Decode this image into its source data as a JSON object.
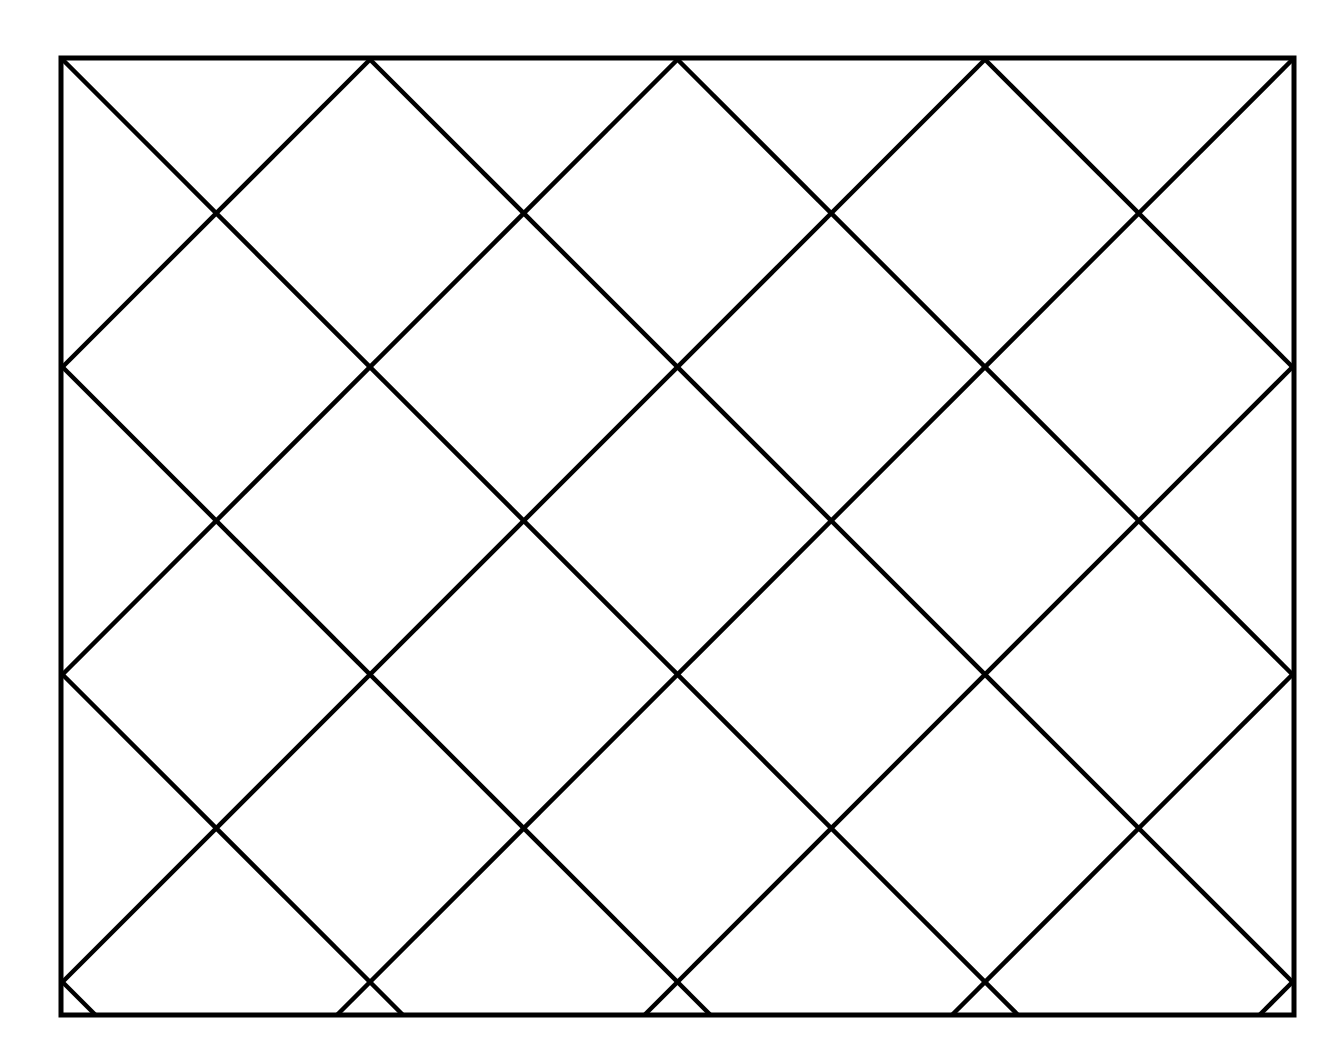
{
  "page": {
    "background_color": "#ffffff",
    "width": 1339,
    "height": 1063,
    "clipped_header_text": ""
  },
  "figure": {
    "name": "diagonal-lattice-diagram",
    "stroke_color": "#000000",
    "fill_color": "#ffffff",
    "border_stroke_width": 5,
    "diagonal_stroke_width": 4.5,
    "frame": {
      "x_left": 61,
      "y_top": 58,
      "x_right": 1294,
      "y_bottom": 1015,
      "width": 1233,
      "height": 957
    },
    "lattice": {
      "angle_degrees": 45,
      "spacing": 307.5,
      "top_edge_vertices_x": [
        61,
        368,
        676,
        983,
        1294
      ],
      "bottom_edge_vertices_x": [
        61,
        364,
        676,
        983,
        1294
      ],
      "left_edge_vertices_y": [
        58,
        377,
        691,
        1015
      ],
      "right_edge_vertices_y": [
        58,
        380,
        691,
        1015
      ],
      "interior_crossings": [
        {
          "x": 215,
          "y": 220
        },
        {
          "x": 519,
          "y": 539
        },
        {
          "x": 983,
          "y": 539
        }
      ],
      "down_right_diagonal_count": 8,
      "down_left_diagonal_count": 8,
      "full_diamond_count": 6
    }
  }
}
